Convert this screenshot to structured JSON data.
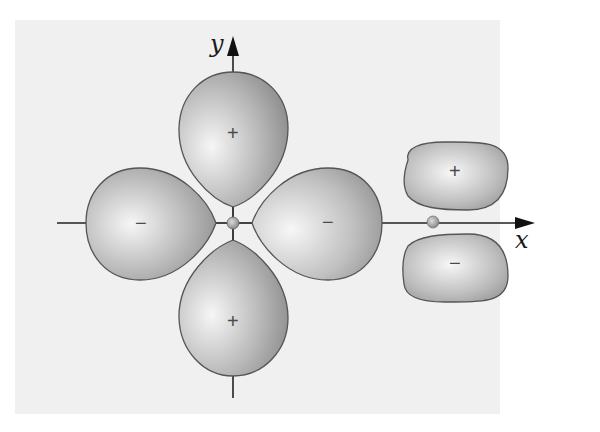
{
  "diagram": {
    "axes": {
      "x_label": "x",
      "y_label": "y"
    },
    "d_orbital": {
      "lobes": [
        {
          "position": "top",
          "sign": "+"
        },
        {
          "position": "bottom",
          "sign": "+"
        },
        {
          "position": "left",
          "sign": "−"
        },
        {
          "position": "right",
          "sign": "−"
        }
      ]
    },
    "p_orbital": {
      "lobes": [
        {
          "position": "upper",
          "sign": "+"
        },
        {
          "position": "lower",
          "sign": "−"
        }
      ]
    },
    "colors": {
      "panel": "#f0f0f0",
      "lobe_light": "#f4f4f4",
      "lobe_dark": "#8a8a8a",
      "outline": "#555555",
      "axis": "#222222",
      "nucleus": "#a0a0a0"
    }
  }
}
